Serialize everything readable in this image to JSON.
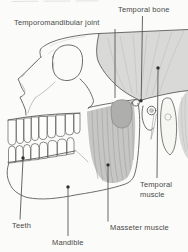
{
  "figure": {
    "type": "anatomical-diagram"
  },
  "canvas": {
    "width": 188,
    "height": 252,
    "background": "#fbfbf9"
  },
  "palette": {
    "line": "#5c5c5c",
    "label_text": "#4a4a4a",
    "temporalis_fill": "#d9d9d8",
    "temporalis_fiber": "#c3c3c2",
    "masseter_fill": "#c6c6c5",
    "masseter_fiber": "#9c9c9b",
    "marker_dot": "#2f2f2f"
  },
  "labels": {
    "temporal_bone": "Temporal bone",
    "temporomandibular_joint": "Temporomandibular joint",
    "temporal_muscle": "Temporal muscle",
    "masseter_muscle": "Masseter muscle",
    "teeth": "Teeth",
    "mandible": "Mandible"
  }
}
